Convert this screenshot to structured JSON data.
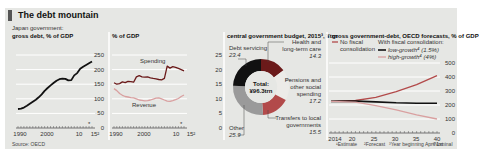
{
  "header": {
    "title": "The debt mountain",
    "subtitle": "Japan government:",
    "source": "Source: OECD"
  },
  "panels": {
    "p1": {
      "title": "gross debt, % of GDP"
    },
    "p2": {
      "title": "% of GDP"
    },
    "p3": {
      "title": "central government budget, 2015³, ¥trn"
    },
    "p4": {
      "title": "gross government-debt, OECD forecasts, % of GDP"
    }
  },
  "footnotes": {
    "f1": "¹Estimate",
    "f2": "²Forecast",
    "f3": "³Year beginning April 1st",
    "f4": "⁴Nominal"
  },
  "colors": {
    "panel_bg": "#e6e7e4",
    "grid": "#ffffff",
    "black": "#111111",
    "dark_red": "#6b1a1a",
    "red": "#b24a4a",
    "pink": "#d9a0a0",
    "grey": "#9a9a9a"
  },
  "chart_data": [
    {
      "type": "line",
      "title": "gross debt, % of GDP",
      "subtitle": "Japan government:",
      "xlabel": "",
      "ylabel": "% of GDP",
      "ylim": [
        0,
        250
      ],
      "yticks": [
        0,
        50,
        100,
        150,
        200,
        250
      ],
      "xticks": [
        "1990",
        "2000",
        "10",
        "15²"
      ],
      "x": [
        1990,
        1991,
        1992,
        1993,
        1994,
        1995,
        1996,
        1997,
        1998,
        1999,
        2000,
        2001,
        2002,
        2003,
        2004,
        2005,
        2006,
        2007,
        2008,
        2009,
        2010,
        2011,
        2012,
        2013,
        2014,
        2015
      ],
      "series": [
        {
          "name": "Gross debt",
          "values": [
            65,
            66,
            70,
            76,
            83,
            90,
            97,
            105,
            115,
            127,
            137,
            146,
            154,
            162,
            167,
            169,
            168,
            163,
            164,
            180,
            188,
            203,
            210,
            216,
            222,
            228
          ]
        }
      ],
      "annotations": [
        "* marker near 2015 (estimate)"
      ],
      "grid": true
    },
    {
      "type": "line",
      "title": "% of GDP",
      "ylim": [
        0,
        25
      ],
      "yticks": [
        0,
        5,
        10,
        15,
        20,
        25
      ],
      "xticks": [
        "1990",
        "2000",
        "10",
        "15²"
      ],
      "x": [
        1990,
        1991,
        1992,
        1993,
        1994,
        1995,
        1996,
        1997,
        1998,
        1999,
        2000,
        2001,
        2002,
        2003,
        2004,
        2005,
        2006,
        2007,
        2008,
        2009,
        2010,
        2011,
        2012,
        2013,
        2014,
        2015
      ],
      "series": [
        {
          "name": "Spending",
          "values": [
            15.5,
            15.0,
            15.2,
            15.8,
            15.5,
            16.0,
            15.9,
            15.7,
            17.5,
            17.9,
            17.5,
            17.4,
            17.5,
            17.2,
            17.0,
            16.8,
            16.6,
            16.5,
            17.0,
            21.2,
            20.5,
            21.0,
            20.8,
            20.4,
            20.0,
            19.6
          ]
        },
        {
          "name": "Revenue",
          "values": [
            13.5,
            12.8,
            11.8,
            11.2,
            10.8,
            10.6,
            10.4,
            10.3,
            10.0,
            9.6,
            9.5,
            9.3,
            9.4,
            9.6,
            9.9,
            10.2,
            10.3,
            10.0,
            9.6,
            9.2,
            9.1,
            9.4,
            9.7,
            10.1,
            10.8,
            11.3
          ]
        }
      ],
      "annotations": [
        "Spending",
        "Revenue",
        "* marker near 2015"
      ],
      "grid": true
    },
    {
      "type": "pie",
      "title": "central government budget, 2015³, ¥trn",
      "center_label": "Total: ¥96.3trn",
      "categories": [
        "Debt servicing",
        "Health and long-term care",
        "Pensions and other social spending",
        "Transfers to local governments",
        "Other"
      ],
      "values": [
        23.4,
        14.3,
        17.2,
        15.5,
        25.9
      ],
      "total": 96.3
    },
    {
      "type": "line",
      "title": "gross government-debt, OECD forecasts, % of GDP",
      "ylim": [
        0,
        500
      ],
      "yticks": [
        0,
        100,
        200,
        300,
        400,
        500
      ],
      "xticks": [
        "2014",
        "20",
        "25",
        "30",
        "35",
        "40"
      ],
      "x": [
        2014,
        2020,
        2025,
        2030,
        2035,
        2040
      ],
      "series": [
        {
          "name": "No fiscal consolidation",
          "values": [
            226,
            232,
            255,
            295,
            345,
            410
          ]
        },
        {
          "name": "With fiscal consolidation: low-growth⁴ (1.5%)",
          "values": [
            226,
            228,
            222,
            216,
            213,
            212
          ]
        },
        {
          "name": "With fiscal consolidation: high-growth⁴ (4%)",
          "values": [
            226,
            220,
            195,
            165,
            130,
            100
          ]
        }
      ],
      "legend_position": "top",
      "grid": true
    }
  ]
}
